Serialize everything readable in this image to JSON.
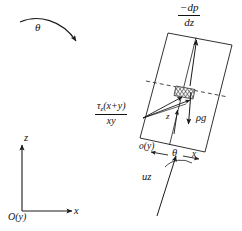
{
  "figure": {
    "type": "diagram",
    "stroke_color": "#1a1a1a",
    "background_color": "#ffffff",
    "labels": {
      "pressure_gradient": {
        "name": "negative-pressure-gradient",
        "numerator": "−dp",
        "denominator": "dz",
        "kind": "fraction"
      },
      "shear_stress": {
        "name": "wall-shear-stress-term",
        "numerator_pre": "τ",
        "numerator_sub": "z",
        "numerator_post": "(x+y)",
        "denominator": "xy",
        "kind": "fraction"
      },
      "inclination_arrow": "θ",
      "gravity": "ρg",
      "element_z": "z",
      "element_offset": "o(y)",
      "element_theta": "θ",
      "element_x": "x",
      "velocity": "uz",
      "axis_z": "z",
      "axis_x": "x",
      "origin": "O(y)"
    },
    "geometry": {
      "box_corners": [
        [
          168,
          33
        ],
        [
          232,
          45
        ],
        [
          205,
          152
        ],
        [
          140,
          138
        ]
      ],
      "hatched_element": {
        "x": 176,
        "y": 85,
        "width": 19,
        "height": 12
      },
      "dashed_centerline_y": 92,
      "axes_origin": [
        22,
        211
      ]
    }
  }
}
